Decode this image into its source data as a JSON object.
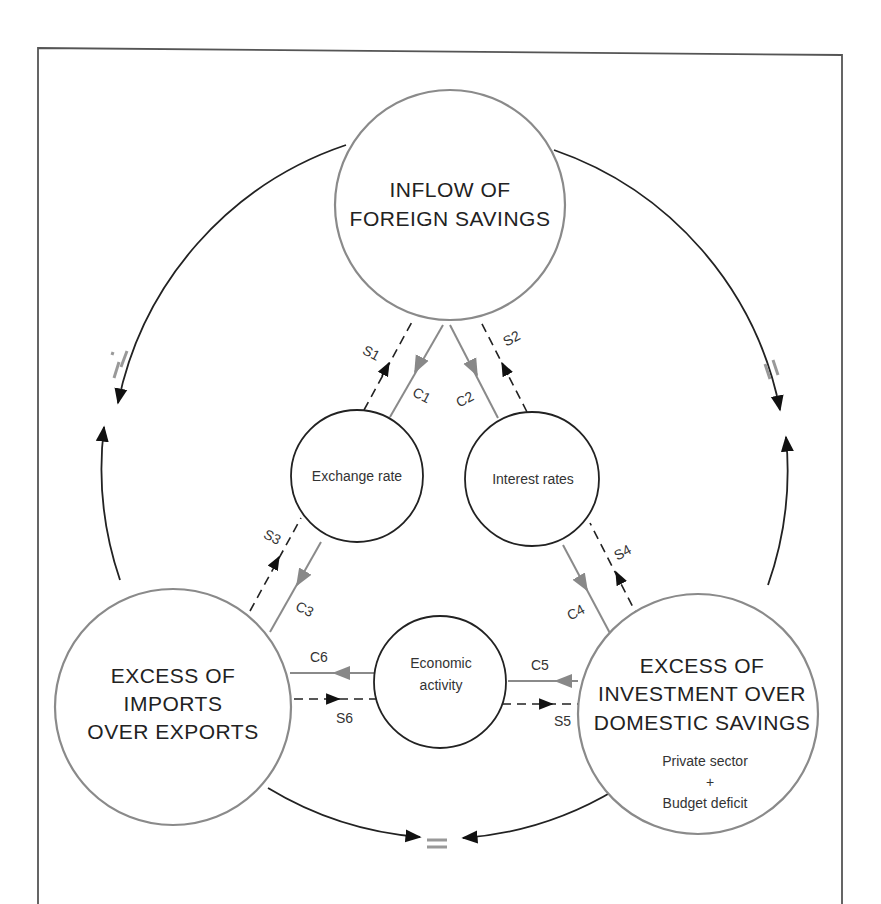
{
  "diagram": {
    "nodes": {
      "top": {
        "lines": [
          "INFLOW OF",
          "FOREIGN SAVINGS"
        ]
      },
      "exchange": {
        "label": "Exchange rate"
      },
      "interest": {
        "label": "Interest rates"
      },
      "economic": {
        "lines": [
          "Economic",
          "activity"
        ]
      },
      "left": {
        "lines": [
          "EXCESS OF",
          "IMPORTS",
          "OVER EXPORTS"
        ]
      },
      "right": {
        "lines": [
          "EXCESS OF",
          "INVESTMENT OVER",
          "DOMESTIC SAVINGS"
        ],
        "sub": [
          "Private sector",
          "+",
          "Budget deficit"
        ]
      }
    },
    "flows": {
      "c1": "C1",
      "c2": "C2",
      "c3": "C3",
      "c4": "C4",
      "c5": "C5",
      "c6": "C6",
      "s1": "S1",
      "s2": "S2",
      "s3": "S3",
      "s4": "S4",
      "s5": "S5",
      "s6": "S6"
    },
    "equals_sign": "=",
    "legend_colors": {
      "causal_flow": "#8a8a8a",
      "savings_flow": "#222222"
    }
  }
}
